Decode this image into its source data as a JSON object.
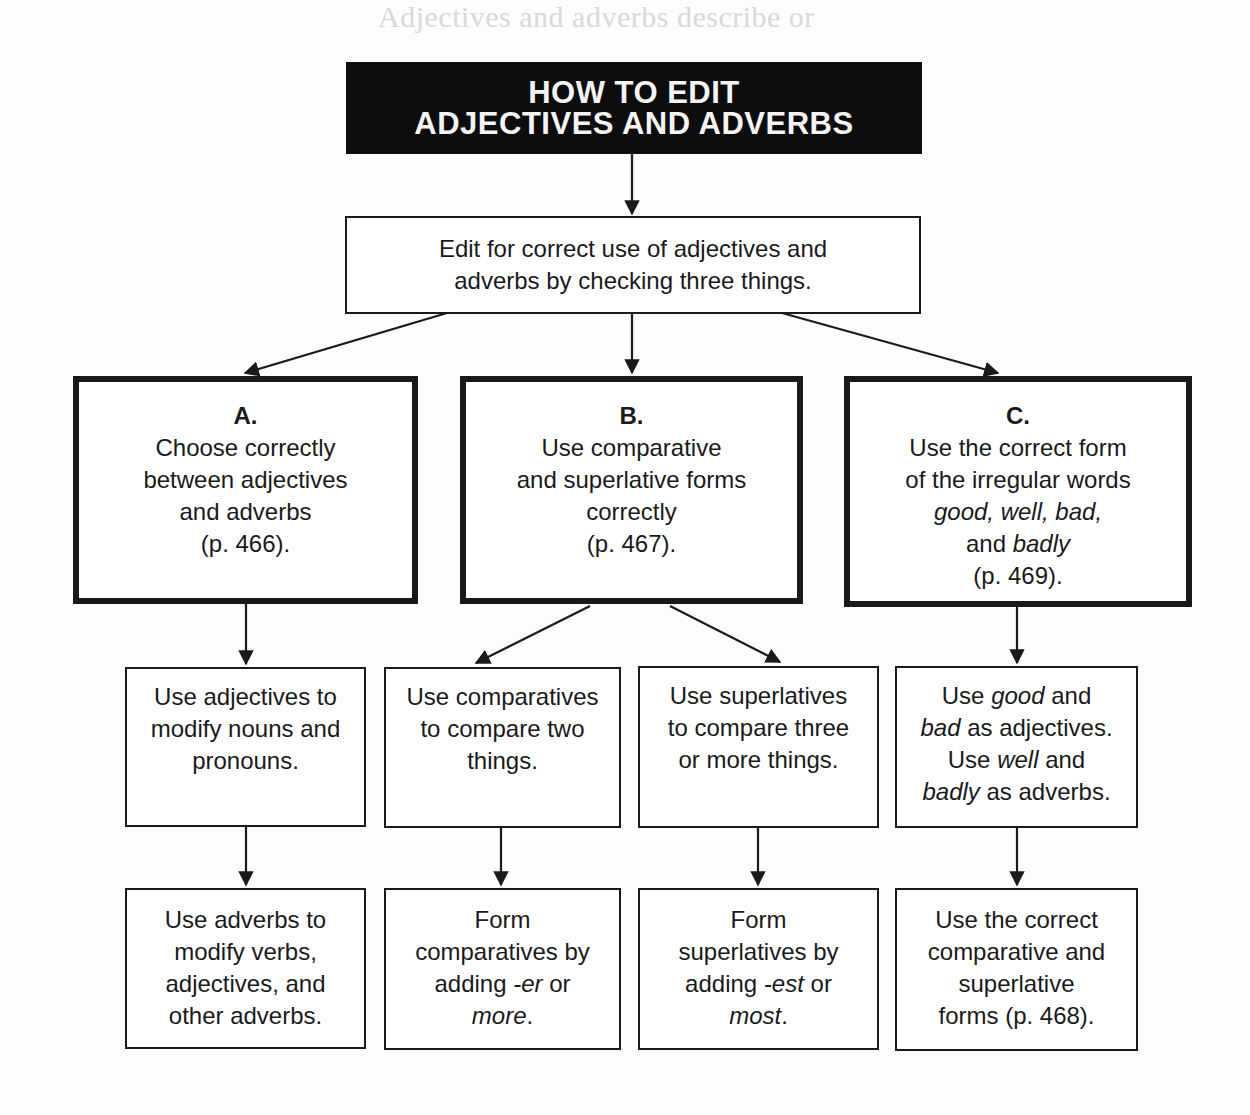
{
  "background_bleed_text": "Adjectives and adverbs describe or",
  "title": {
    "line1": "HOW TO EDIT",
    "line2": "ADJECTIVES AND ADVERBS"
  },
  "intro": {
    "line1": "Edit for correct use of adjectives and",
    "line2": "adverbs by checking three things."
  },
  "categories": [
    {
      "letter": "A.",
      "lines": [
        "Choose correctly",
        "between adjectives",
        "and adverbs",
        "(p. 466)."
      ]
    },
    {
      "letter": "B.",
      "lines": [
        "Use comparative",
        "and superlative forms",
        "correctly",
        "(p. 467)."
      ]
    },
    {
      "letter": "C.",
      "line1": "Use the correct form",
      "line2": "of the irregular words",
      "line3_italic": "good, well, bad,",
      "line4_pre": "and ",
      "line4_italic": "badly",
      "line5": "(p. 469)."
    }
  ],
  "rules": {
    "adjectives": {
      "lines": [
        "Use adjectives to",
        "modify nouns and",
        "pronouns."
      ]
    },
    "comparatives": {
      "lines": [
        "Use comparatives",
        "to compare two",
        "things."
      ]
    },
    "superlatives": {
      "lines": [
        "Use superlatives",
        "to compare three",
        "or more things."
      ]
    },
    "irregular": {
      "l1_pre": "Use ",
      "l1_it": "good",
      "l1_post": " and",
      "l2_it": "bad",
      "l2_post": " as adjectives.",
      "l3_pre": "Use ",
      "l3_it": "well",
      "l3_post": " and",
      "l4_it": "badly",
      "l4_post": " as adverbs."
    }
  },
  "details": {
    "adverbs": {
      "lines": [
        "Use adverbs to",
        "modify verbs,",
        "adjectives, and",
        "other adverbs."
      ]
    },
    "form_comparatives": {
      "l1": "Form",
      "l2": "comparatives by",
      "l3_pre": "adding ",
      "l3_it": "-er",
      "l3_post": " or",
      "l4_it": "more",
      "l4_post": "."
    },
    "form_superlatives": {
      "l1": "Form",
      "l2": "superlatives by",
      "l3_pre": "adding ",
      "l3_it": "-est",
      "l3_post": " or",
      "l4_it": "most",
      "l4_post": "."
    },
    "irregular_forms": {
      "lines": [
        "Use the correct",
        "comparative and",
        "superlative",
        "forms (p. 468)."
      ]
    }
  },
  "colors": {
    "title_bg": "#0d0d0d",
    "title_text": "#f4f4f4",
    "ink": "#1a1a1a",
    "paper": "#fdfdfd"
  }
}
